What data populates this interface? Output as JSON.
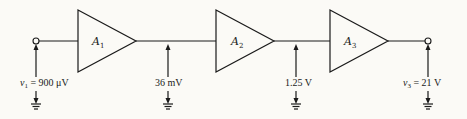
{
  "diagram": {
    "type": "cascaded-amplifier-block-diagram",
    "amplifiers": [
      {
        "symbol": "A",
        "subscript": "1"
      },
      {
        "symbol": "A",
        "subscript": "2"
      },
      {
        "symbol": "A",
        "subscript": "3"
      }
    ],
    "measurements": {
      "input": {
        "var": "v",
        "sub": "1",
        "eq": " = 900 μV"
      },
      "stage1_out": {
        "text": "36 mV"
      },
      "stage2_out": {
        "text": "1.25 V"
      },
      "output": {
        "var": "v",
        "sub": "3",
        "eq": " = 21 V"
      }
    }
  }
}
